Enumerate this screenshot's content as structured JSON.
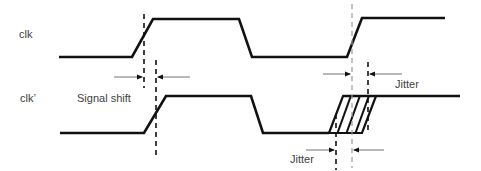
{
  "diagram": {
    "type": "timing-diagram",
    "colors": {
      "waveform": "#111111",
      "dash_dark": "#111111",
      "dash_gray": "#9a9a9a",
      "arrow": "#707070",
      "text": "#404040"
    },
    "signals": [
      {
        "name": "clk",
        "label": "clk"
      },
      {
        "name": "clk-prime",
        "label": "clk’"
      }
    ],
    "annotations": {
      "signal_shift": "Signal shift",
      "jitter_top": "Jitter",
      "jitter_bottom": "Jitter"
    }
  }
}
